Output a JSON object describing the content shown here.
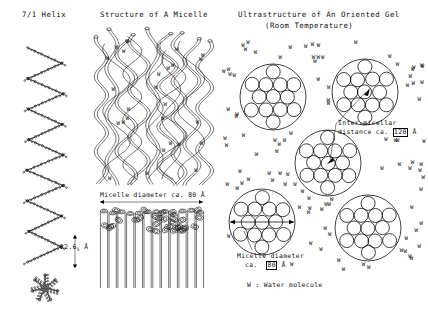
{
  "figure": {
    "background": "#ffffff",
    "ink": "#000000",
    "width": 428,
    "height": 324
  },
  "panels": {
    "left": {
      "title": "7/1 Helix",
      "title_x": 22,
      "title_y": 10,
      "measurement": {
        "value": "22.6",
        "subscript": "5",
        "unit": "Å",
        "label_x": 60,
        "label_y": 243
      },
      "helix": {
        "turns": 7,
        "top_y": 48,
        "bottom_y": 262,
        "center_x": 45,
        "amplitude": 17
      },
      "projection": {
        "center_x": 45,
        "center_y": 288,
        "radius": 13,
        "arms": 7
      }
    },
    "middle": {
      "title": "Structure of A Micelle",
      "title_x": 100,
      "title_y": 10,
      "caption": "Micelle diameter ca. 80 Å",
      "caption_x": 100,
      "caption_y": 191,
      "arrow": {
        "x1": 100,
        "x2": 203,
        "y": 202
      },
      "chains": {
        "count": 9,
        "top_y": 28,
        "bottom_y": 186
      },
      "bundle": {
        "rod_count": 12,
        "top_y": 208,
        "bottom_y": 288
      }
    },
    "right": {
      "title": "Ultrastructure of An Oriented Gel",
      "subtitle": "(Room Temperature)",
      "title_x": 238,
      "title_y": 10,
      "subtitle_x": 265,
      "subtitle_y": 21,
      "annotations": [
        {
          "name": "inter-micellar-distance",
          "line1": "Inter-micellar",
          "line2_prefix": "distance ca.",
          "line2_value": "120",
          "line2_unit": "Å",
          "x": 338,
          "y": 119
        },
        {
          "name": "micelle-diameter",
          "line1": "Micelle diameter",
          "line2_prefix": "ca.",
          "line2_value": "80",
          "line2_unit": "Å",
          "x": 237,
          "y": 252
        }
      ],
      "legend": {
        "text": "W : Water molecule",
        "x": 247,
        "y": 281
      },
      "clusters": [
        {
          "cx": 273,
          "cy": 97,
          "r": 33,
          "inner_r": 7.0
        },
        {
          "cx": 365,
          "cy": 92,
          "r": 33,
          "inner_r": 7.0
        },
        {
          "cx": 328,
          "cy": 163,
          "r": 33,
          "inner_r": 7.0
        },
        {
          "cx": 262,
          "cy": 222,
          "r": 33,
          "inner_r": 7.0
        },
        {
          "cx": 368,
          "cy": 228,
          "r": 33,
          "inner_r": 7.0
        }
      ],
      "water_symbol": "W",
      "water_count": 96
    }
  }
}
